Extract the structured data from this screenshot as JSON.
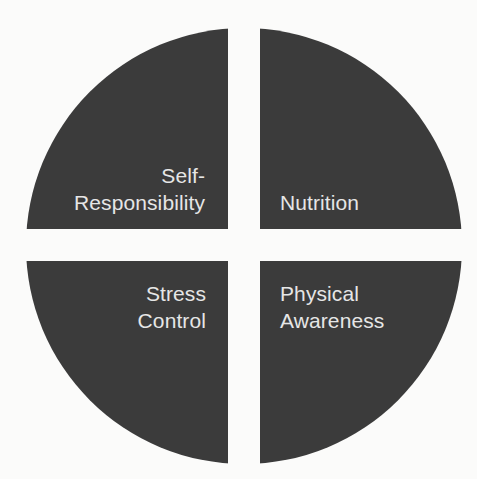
{
  "diagram": {
    "type": "quadrant-wheel",
    "fill_color": "#3b3b3b",
    "background_color": "#fbfbfa",
    "text_color": "#e6e6e6",
    "center": [
      244,
      246
    ],
    "radius": 218,
    "gap": 32,
    "quadrants": [
      {
        "position": "top-left",
        "label_lines": [
          "Self-",
          "Responsibility"
        ]
      },
      {
        "position": "top-right",
        "label_lines": [
          "Nutrition"
        ]
      },
      {
        "position": "bottom-left",
        "label_lines": [
          "Stress",
          "Control"
        ]
      },
      {
        "position": "bottom-right",
        "label_lines": [
          "Physical",
          "Awareness"
        ]
      }
    ]
  }
}
